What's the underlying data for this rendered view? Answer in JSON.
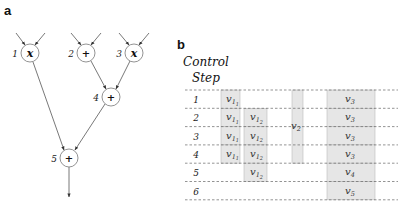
{
  "panel_a": {
    "label": "a",
    "nodes": [
      {
        "id": "1",
        "op": "x"
      },
      {
        "id": "2",
        "op": "+"
      },
      {
        "id": "3",
        "op": "x"
      },
      {
        "id": "4",
        "op": "+"
      },
      {
        "id": "5",
        "op": "+"
      }
    ],
    "edges": [
      {
        "from": "input",
        "to": "1"
      },
      {
        "from": "input",
        "to": "1"
      },
      {
        "from": "input",
        "to": "2"
      },
      {
        "from": "input",
        "to": "2"
      },
      {
        "from": "input",
        "to": "3"
      },
      {
        "from": "input",
        "to": "3"
      },
      {
        "from": "2",
        "to": "4"
      },
      {
        "from": "3",
        "to": "4"
      },
      {
        "from": "1",
        "to": "5"
      },
      {
        "from": "4",
        "to": "5"
      },
      {
        "from": "5",
        "to": "output"
      }
    ]
  },
  "panel_b": {
    "label": "b",
    "header_line1": "Control",
    "header_line2": "Step",
    "steps": [
      "1",
      "2",
      "3",
      "4",
      "5",
      "6"
    ],
    "columns": [
      {
        "name": "v1_1",
        "text": "v",
        "sub": "1",
        "subsub": "1",
        "start_step": 1,
        "end_step": 4,
        "per_row": true
      },
      {
        "name": "v1_2",
        "text": "v",
        "sub": "1",
        "subsub": "2",
        "start_step": 2,
        "end_step": 5,
        "per_row": true
      },
      {
        "name": "v2",
        "text": "v",
        "sub": "2",
        "start_step": 1,
        "end_step": 4,
        "per_row": false
      },
      {
        "name": "v3_v4_v5",
        "per_row": true,
        "start_step": 1,
        "end_step": 6,
        "rows": [
          {
            "step": 1,
            "text": "v",
            "sub": "3"
          },
          {
            "step": 2,
            "text": "v",
            "sub": "3"
          },
          {
            "step": 3,
            "text": "v",
            "sub": "3"
          },
          {
            "step": 4,
            "text": "v",
            "sub": "3"
          },
          {
            "step": 5,
            "text": "v",
            "sub": "4"
          },
          {
            "step": 6,
            "text": "v",
            "sub": "5"
          }
        ]
      }
    ]
  },
  "colors": {
    "cell_fill": "#e6e6e6",
    "cell_border": "#b8b8b8",
    "dash_line": "#666666",
    "edge": "#444444"
  }
}
